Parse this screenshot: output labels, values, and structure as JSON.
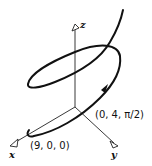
{
  "diagram": {
    "axes": {
      "x_label": "x",
      "y_label": "y",
      "z_label": "z"
    },
    "points": [
      {
        "label": "(9, 0, 0)",
        "description": "start point of helix on x-axis"
      },
      {
        "label": "(0, 4, π/2)",
        "description": "point on helix after quarter turn, with direction arrow"
      }
    ],
    "colors": {
      "stroke": "#111111",
      "background": "#ffffff"
    }
  }
}
